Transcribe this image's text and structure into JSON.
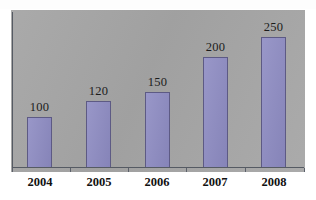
{
  "chart_data": {
    "type": "bar",
    "title": "",
    "xlabel": "",
    "ylabel": "",
    "categories": [
      "2004",
      "2005",
      "2006",
      "2007",
      "2008"
    ],
    "values": [
      100,
      120,
      150,
      200,
      250
    ],
    "value_labels": [
      "100",
      "120",
      "150",
      "200",
      "250"
    ],
    "ylim": [
      0,
      280
    ],
    "grid": false,
    "legend": false,
    "series": [
      {
        "name": "",
        "values": [
          100,
          120,
          150,
          200,
          250
        ]
      }
    ],
    "colors": {
      "bar_fill": "#8d8bc2",
      "bar_border": "#5d5a84",
      "plot_background": "#a9a9a9",
      "axis": "#555a63",
      "text": "#111111",
      "page_background": "#ffffff"
    }
  },
  "bars": [
    {
      "category": "2004",
      "value": 100,
      "label": "100",
      "left": 27,
      "width": 25,
      "top": 117,
      "label_left": 22,
      "label_top": 100,
      "tick_x": 12
    },
    {
      "category": "2005",
      "value": 120,
      "label": "120",
      "left": 86,
      "width": 25,
      "top": 101,
      "label_left": 81,
      "label_top": 84,
      "tick_x": 70
    },
    {
      "category": "2006",
      "value": 150,
      "label": "150",
      "left": 145,
      "width": 25,
      "top": 92,
      "label_left": 140,
      "label_top": 75,
      "tick_x": 128
    },
    {
      "category": "2007",
      "value": 200,
      "label": "200",
      "left": 203,
      "width": 25,
      "top": 57,
      "label_left": 198,
      "label_top": 40,
      "tick_x": 186
    },
    {
      "category": "2008",
      "value": 250,
      "label": "250",
      "left": 261,
      "width": 25,
      "top": 37,
      "label_left": 256,
      "label_top": 20,
      "tick_x": 245
    }
  ],
  "axis_ticks_extra": [
    304
  ],
  "category_label_positions": [
    {
      "left": 22,
      "width": 36
    },
    {
      "left": 81,
      "width": 36
    },
    {
      "left": 139,
      "width": 36
    },
    {
      "left": 197,
      "width": 36
    },
    {
      "left": 256,
      "width": 36
    }
  ]
}
